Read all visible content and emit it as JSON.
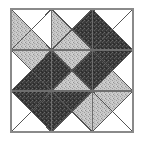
{
  "figure": {
    "canvas": {
      "width": 143,
      "height": 142,
      "background": "#ffffff"
    },
    "square": {
      "x": 11,
      "y": 9,
      "width": 122,
      "height": 123
    },
    "grid": {
      "rows": 3,
      "cols": 3,
      "cell_width": 40.67,
      "cell_height": 41.0
    },
    "colors": {
      "background": "#ffffff",
      "white_fill": "#ffffff",
      "light_fill": "#c4c4c4",
      "dark_fill": "#3a3a3a",
      "outline": "#555555",
      "grid_line": "#6e6e6e",
      "border": "#8a8a8a"
    },
    "fill_legend": [
      {
        "key": "white",
        "label": "plain white"
      },
      {
        "key": "light",
        "label": "light stipple gray"
      },
      {
        "key": "dark",
        "label": "dark stipple gray"
      }
    ],
    "cells": [
      {
        "row": 0,
        "col": 0,
        "name": "block-r0-c0",
        "north": "white",
        "east": "white",
        "south": "light",
        "west": "light"
      },
      {
        "row": 0,
        "col": 1,
        "name": "block-r0-c1",
        "north": "white",
        "east": "dark",
        "south": "light",
        "west": "light"
      },
      {
        "row": 0,
        "col": 2,
        "name": "block-r0-c2",
        "north": "white",
        "east": "white",
        "south": "dark",
        "west": "dark"
      },
      {
        "row": 1,
        "col": 0,
        "name": "block-r1-c0",
        "north": "light",
        "east": "dark",
        "south": "dark",
        "west": "white"
      },
      {
        "row": 1,
        "col": 1,
        "name": "block-r1-c1",
        "north": "light",
        "east": "dark",
        "south": "light",
        "west": "dark"
      },
      {
        "row": 1,
        "col": 2,
        "name": "block-r1-c2",
        "north": "dark",
        "east": "white",
        "south": "light",
        "west": "dark"
      },
      {
        "row": 2,
        "col": 0,
        "name": "block-r2-c0",
        "north": "dark",
        "east": "dark",
        "south": "white",
        "west": "white"
      },
      {
        "row": 2,
        "col": 1,
        "name": "block-r2-c1",
        "north": "dark",
        "east": "light",
        "south": "white",
        "west": "dark"
      },
      {
        "row": 2,
        "col": 2,
        "name": "block-r2-c2",
        "north": "light",
        "east": "white",
        "south": "white",
        "west": "light"
      }
    ]
  }
}
